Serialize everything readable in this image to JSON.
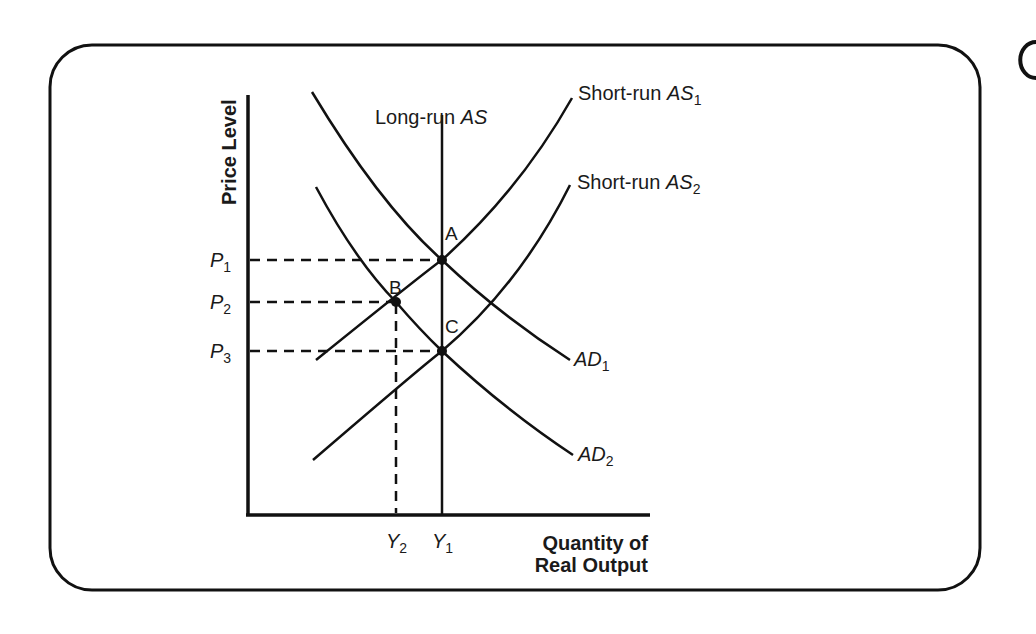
{
  "diagram": {
    "type": "aggregate-demand-aggregate-supply",
    "y_axis_label": "Price Level",
    "x_axis_label_line1": "Quantity of",
    "x_axis_label_line2": "Real Output",
    "curves": {
      "lras": {
        "label": "Long-run ",
        "label_italic": "AS",
        "sub": ""
      },
      "sras1": {
        "label": "Short-run ",
        "label_italic": "AS",
        "sub": "1"
      },
      "sras2": {
        "label": "Short-run ",
        "label_italic": "AS",
        "sub": "2"
      },
      "ad1": {
        "label_italic": "AD",
        "sub": "1"
      },
      "ad2": {
        "label_italic": "AD",
        "sub": "2"
      }
    },
    "points": {
      "a": "A",
      "b": "B",
      "c": "C"
    },
    "price_levels": [
      {
        "main": "P",
        "sub": "1"
      },
      {
        "main": "P",
        "sub": "2"
      },
      {
        "main": "P",
        "sub": "3"
      }
    ],
    "output_levels": [
      {
        "main": "Y",
        "sub": "2"
      },
      {
        "main": "Y",
        "sub": "1"
      }
    ],
    "colors": {
      "line": "#111111",
      "background": "#ffffff"
    }
  }
}
